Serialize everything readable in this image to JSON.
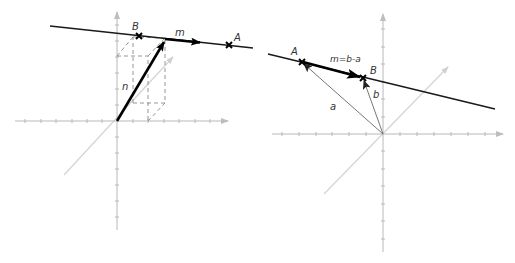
{
  "figure": {
    "left_panel": {
      "description": "3D axes with line through B and A, vector n from origin to a point on the line, direction vector m along the line",
      "labels": {
        "B": "B",
        "A": "A",
        "m": "m",
        "n": "n"
      }
    },
    "right_panel": {
      "description": "Line through points A and B with position vectors a and b from origin; m = b - a along the line",
      "labels": {
        "A": "A",
        "B": "B",
        "m": "m=b-a",
        "a": "a",
        "b": "b"
      }
    },
    "colors": {
      "axis": "#b8b8b8",
      "diagonal_axis": "#d4d4d4",
      "line": "#1a1a1a",
      "vector_thin": "#666666",
      "dashed": "#8a8a8a"
    }
  }
}
